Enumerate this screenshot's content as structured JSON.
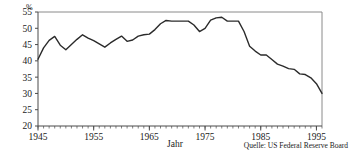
{
  "chart_data": {
    "type": "line",
    "title": "",
    "subtitle": "",
    "xlabel": "Jahr",
    "ylabel": "%",
    "unit": "%",
    "source": "Quelle: US Federal Reserve Board",
    "grid": false,
    "legend": "none",
    "xlim": [
      1945,
      1996
    ],
    "ylim": [
      20,
      55
    ],
    "ytick_labels": [
      "20",
      "25",
      "30",
      "35",
      "40",
      "45",
      "50",
      "55"
    ],
    "yticks": [
      20,
      25,
      30,
      35,
      40,
      45,
      50,
      55
    ],
    "xtick_labels": [
      "1945",
      "1955",
      "1965",
      "1975",
      "1985",
      "1995"
    ],
    "xticks": [
      1945,
      1955,
      1965,
      1975,
      1985,
      1995
    ],
    "minor_xtick_interval": 1,
    "series": [
      {
        "name": "Anteil",
        "color": "#2b2b2b",
        "x": [
          1945,
          1946,
          1947,
          1948,
          1949,
          1950,
          1951,
          1952,
          1953,
          1954,
          1955,
          1956,
          1957,
          1958,
          1959,
          1960,
          1961,
          1962,
          1963,
          1964,
          1965,
          1966,
          1967,
          1968,
          1969,
          1970,
          1971,
          1972,
          1973,
          1974,
          1975,
          1976,
          1977,
          1978,
          1979,
          1980,
          1981,
          1982,
          1983,
          1984,
          1985,
          1986,
          1987,
          1988,
          1989,
          1990,
          1991,
          1992,
          1993,
          1994,
          1995,
          1996
        ],
        "values": [
          40.5,
          44.0,
          46.3,
          47.5,
          44.8,
          43.4,
          45.0,
          46.6,
          48.0,
          47.0,
          46.2,
          45.2,
          44.2,
          45.5,
          46.6,
          47.6,
          46.0,
          46.4,
          47.6,
          48.0,
          48.2,
          49.6,
          51.4,
          52.4,
          52.2,
          52.2,
          52.2,
          52.2,
          51.0,
          49.0,
          50.0,
          52.5,
          53.2,
          53.4,
          52.2,
          52.2,
          52.2,
          49.0,
          44.5,
          43.0,
          41.8,
          41.8,
          40.4,
          39.0,
          38.4,
          37.6,
          37.4,
          36.0,
          35.8,
          34.8,
          33.0,
          30.0
        ]
      }
    ]
  },
  "axes": {
    "y_unit_label": "%",
    "x_axis_title": "Jahr"
  },
  "footer": {
    "source_text": "Quelle: US Federal Reserve Board"
  }
}
